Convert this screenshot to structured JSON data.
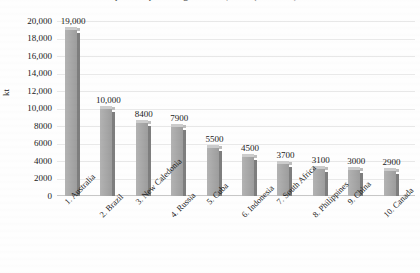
{
  "chart_data": {
    "type": "bar",
    "title": "Top nickel producing countries, 2019 (estimated)",
    "xlabel": "",
    "ylabel": "kt",
    "ylim": [
      0,
      20000
    ],
    "ytick_step": 2000,
    "grid": true,
    "legend": "none",
    "categories": [
      "1. Australia",
      "2. Brazil",
      "3. New Caledonia",
      "4. Russia",
      "5. Cuba",
      "6. Indonesia",
      "7. South Africa",
      "8. Philippines",
      "9. China",
      "10. Canada"
    ],
    "values": [
      19000,
      10000,
      8400,
      7900,
      5500,
      4500,
      3700,
      3100,
      3000,
      2900
    ],
    "value_labels": [
      "19,000",
      "10,000",
      "8400",
      "7900",
      "5500",
      "4500",
      "3700",
      "3100",
      "3000",
      "2900"
    ],
    "ytick_labels": [
      "20,000",
      "18,000",
      "16,000",
      "14,000",
      "12,000",
      "10,000",
      "8000",
      "6000",
      "4000",
      "2000",
      "0"
    ],
    "ytick_values": [
      20000,
      18000,
      16000,
      14000,
      12000,
      10000,
      8000,
      6000,
      4000,
      2000,
      0
    ],
    "colors": {
      "bar_face": "#a9a9a9",
      "bar_side": "#7e7e7e",
      "bar_top": "#cccccc",
      "gridline": "#e9e9e9",
      "axis": "#c8c8c8",
      "text": "#1a1a1a",
      "background": "#fefefe"
    }
  }
}
